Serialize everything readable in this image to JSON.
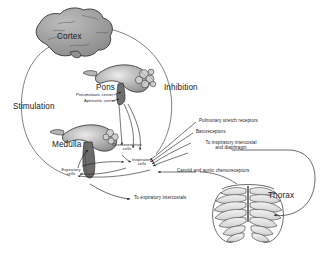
{
  "figure": {
    "background_color": "#ffffff",
    "ink_color": "#1a1a1a",
    "structure_fill": "#9a9a9a",
    "structure_fill_light": "#c9c9c9"
  },
  "structures": {
    "cortex": {
      "label": "Cortex"
    },
    "pons": {
      "label": "Pons"
    },
    "medulla": {
      "label": "Medulla"
    },
    "thorax": {
      "label": "Thorax"
    }
  },
  "pons_centers": [
    {
      "label": "Pneumotaxic center"
    },
    {
      "label": "Apneustic center"
    }
  ],
  "medulla_cells": [
    {
      "label": "Chemosensitive",
      "label2": "cells"
    },
    {
      "label": "Inspiratory",
      "label2": "cells"
    },
    {
      "label": "Expiratory",
      "label2": "cells"
    }
  ],
  "pathways": {
    "stimulation": "Stimulation",
    "inhibition": "Inhibition"
  },
  "afferents": [
    {
      "label": "Pulmonary stretch receptors"
    },
    {
      "label": "Baroreceptors"
    },
    {
      "label": "Carotid and aortic chemoreceptors"
    }
  ],
  "efferents": [
    {
      "line1": "To inspiratory intercostal",
      "line2": "and diaphragm"
    },
    {
      "line1": "To expiratory intercostals",
      "line2": ""
    }
  ]
}
